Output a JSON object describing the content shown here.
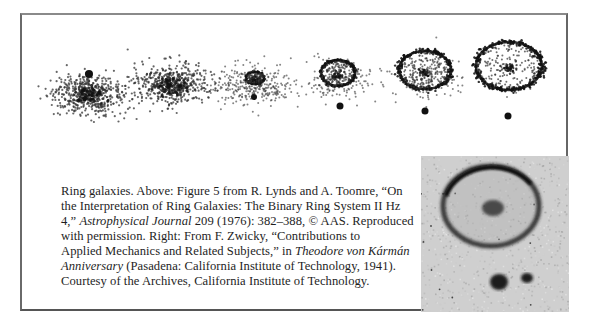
{
  "figure": {
    "title": "Ring galaxies",
    "panels": [
      {
        "label": "galaxy-stage-1",
        "cx": 88,
        "cy": 95,
        "spread_x": 40,
        "spread_y": 22,
        "ring": null,
        "companion": {
          "x": 89,
          "y": 74,
          "r": 4
        }
      },
      {
        "label": "galaxy-stage-2",
        "cx": 172,
        "cy": 85,
        "spread_x": 40,
        "spread_y": 22,
        "ring": null,
        "companion": null
      },
      {
        "label": "galaxy-stage-3",
        "cx": 255,
        "cy": 78,
        "spread_x": 34,
        "spread_y": 20,
        "ring": {
          "rx": 9,
          "ry": 6
        },
        "companion": {
          "x": 254,
          "y": 97,
          "r": 3
        }
      },
      {
        "label": "galaxy-stage-4",
        "cx": 338,
        "cy": 73,
        "spread_x": 30,
        "spread_y": 18,
        "ring": {
          "rx": 17,
          "ry": 13
        },
        "companion": {
          "x": 340,
          "y": 106,
          "r": 3.5
        }
      },
      {
        "label": "galaxy-stage-5",
        "cx": 425,
        "cy": 70,
        "spread_x": 32,
        "spread_y": 20,
        "ring": {
          "rx": 26,
          "ry": 19
        },
        "companion": {
          "x": 425,
          "y": 111,
          "r": 3.5
        }
      },
      {
        "label": "galaxy-stage-6",
        "cx": 509,
        "cy": 66,
        "spread_x": 33,
        "spread_y": 24,
        "ring": {
          "rx": 33,
          "ry": 24
        },
        "companion": {
          "x": 508,
          "y": 116,
          "r": 3.5
        }
      }
    ],
    "colors": {
      "dots": "#333333",
      "ring": "#111111",
      "photo_bg": "#cfcfcf",
      "photo_dark": "#1a1a1a"
    }
  },
  "caption": {
    "lines": [
      {
        "parts": [
          {
            "text": "Ring galaxies. Above: Figure 5 from R. Lynds and A. Toomre, “On",
            "italic": false
          }
        ]
      },
      {
        "parts": [
          {
            "text": "the Interpretation of Ring Galaxies: The Binary Ring System II Hz",
            "italic": false
          }
        ]
      },
      {
        "parts": [
          {
            "text": "4,” ",
            "italic": false
          },
          {
            "text": "Astrophysical Journal",
            "italic": true
          },
          {
            "text": " 209 (1976): 382–388, © AAS. Reproduced",
            "italic": false
          }
        ]
      },
      {
        "parts": [
          {
            "text": "with permission. Right: From F. Zwicky, “Contributions to",
            "italic": false
          }
        ]
      },
      {
        "parts": [
          {
            "text": "Applied Mechanics and Related Subjects,” in ",
            "italic": false
          },
          {
            "text": "Theodore von Kármán",
            "italic": true
          }
        ]
      },
      {
        "parts": [
          {
            "text": "Anniversary",
            "italic": true
          },
          {
            "text": " (Pasadena: California Institute of Technology, 1941).",
            "italic": false
          }
        ]
      },
      {
        "parts": [
          {
            "text": "Courtesy of the Archives, California Institute of Technology.",
            "italic": false
          }
        ]
      }
    ]
  },
  "photo": {
    "label": "Zwicky ring galaxy photograph",
    "ring": {
      "cx": 70,
      "cy": 50,
      "rx": 48,
      "ry": 40
    },
    "nucleus": {
      "cx": 72,
      "cy": 52,
      "rx": 11,
      "ry": 8
    },
    "blobs": [
      {
        "cx": 78,
        "cy": 126,
        "rx": 9,
        "ry": 8
      },
      {
        "cx": 106,
        "cy": 122,
        "rx": 6,
        "ry": 5
      }
    ]
  }
}
